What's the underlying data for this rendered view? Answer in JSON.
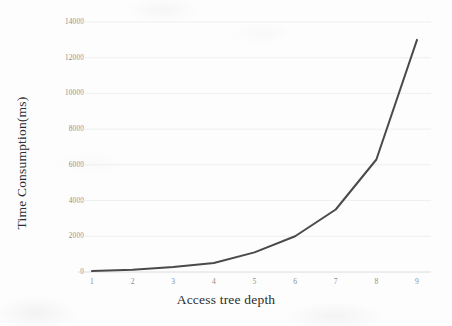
{
  "chart_data": {
    "type": "line",
    "title": "",
    "subtitle": "",
    "xlabel": "Access tree depth",
    "ylabel": "Time Consumption(ms)",
    "x": [
      1,
      2,
      3,
      4,
      5,
      6,
      7,
      8,
      9
    ],
    "xtick_labels": [
      "1",
      "2",
      "3",
      "4",
      "5",
      "6",
      "7",
      "8",
      "9"
    ],
    "ytick_labels": [
      "0",
      "2000",
      "4000",
      "6000",
      "8000",
      "10000",
      "12000",
      "14000"
    ],
    "ytick_values": [
      0,
      2000,
      4000,
      6000,
      8000,
      10000,
      12000,
      14000
    ],
    "series": [
      {
        "name": "Time Consumption",
        "values": [
          50,
          120,
          280,
          500,
          1100,
          2000,
          3500,
          6300,
          13000
        ],
        "color": "#4a4a4a",
        "line_width": 2,
        "markers": false
      }
    ],
    "xlim": [
      1,
      9
    ],
    "ylim": [
      0,
      14000
    ],
    "grid": {
      "horizontal": true,
      "vertical": false,
      "color": "#ebebeb"
    },
    "legend": {
      "visible": false,
      "position": "none"
    },
    "axis": {
      "x_axis_line_color": "#d8d8d8",
      "tick_label_color": "#8d8d8d",
      "axis_title_color": "#2c2c2c"
    },
    "background_color": "#fdfdfd"
  }
}
